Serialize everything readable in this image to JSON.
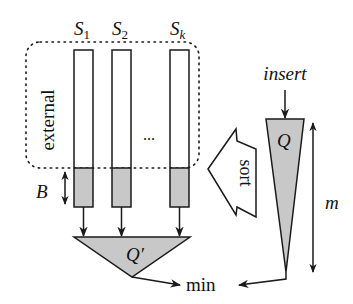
{
  "diagram": {
    "sequences": [
      {
        "label": "S",
        "subscript": "1"
      },
      {
        "label": "S",
        "subscript": "2"
      },
      {
        "label": "S",
        "subscript": "k"
      }
    ],
    "ellipsis": "...",
    "external_label": "external",
    "block_label": "B",
    "merge_queue_label": "Q′",
    "insert_queue_label": "Q",
    "insert_label": "insert",
    "sort_label": "sort",
    "size_label": "m",
    "min_label": "min",
    "colors": {
      "stroke": "#1a1a1a",
      "fill_shaded": "#c8c8c8",
      "background": "#ffffff"
    }
  }
}
